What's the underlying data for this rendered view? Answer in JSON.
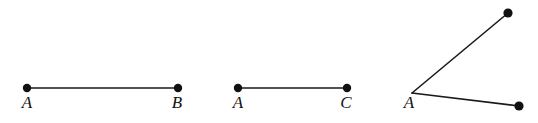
{
  "figure": {
    "background_color": "#ffffff",
    "stroke_color": "#1a1a1a",
    "label_color": "#101010",
    "stroke_width": 1.6,
    "dot_radius": 4.2,
    "width": 538,
    "height": 123
  },
  "diagrams": [
    {
      "id": "segment-ab",
      "type": "line-segment",
      "name": "segment AB",
      "endpoints": [
        {
          "label": "A",
          "x": 27,
          "y": 88,
          "label_x": 27,
          "label_y": 94
        },
        {
          "label": "B",
          "x": 178,
          "y": 88,
          "label_x": 177,
          "label_y": 94
        }
      ]
    },
    {
      "id": "segment-ac",
      "type": "line-segment",
      "name": "segment AC",
      "endpoints": [
        {
          "label": "A",
          "x": 238,
          "y": 88,
          "label_x": 238,
          "label_y": 94
        },
        {
          "label": "C",
          "x": 347,
          "y": 88,
          "label_x": 346,
          "label_y": 94
        }
      ]
    },
    {
      "id": "angle-a",
      "type": "angle",
      "name": "angle with vertex A",
      "vertex": {
        "label": "A",
        "x": 412,
        "y": 93,
        "label_x": 409,
        "label_y": 94
      },
      "rays": [
        {
          "id": "ray-upper",
          "to_x": 508,
          "to_y": 13,
          "endpoint_dot": true,
          "endpoint_label": ""
        },
        {
          "id": "ray-lower",
          "to_x": 519,
          "to_y": 106,
          "endpoint_dot": true,
          "endpoint_label": ""
        }
      ]
    }
  ],
  "labels": {
    "segment_ab_a": "A",
    "segment_ab_b": "B",
    "segment_ac_a": "A",
    "segment_ac_c": "C",
    "angle_vertex_a": "A"
  }
}
